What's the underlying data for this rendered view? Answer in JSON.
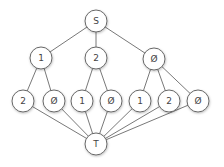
{
  "diagram": {
    "type": "graph",
    "nodes": [
      {
        "id": "S",
        "label": "S",
        "x": 96,
        "y": 21
      },
      {
        "id": "a1",
        "label": "1",
        "x": 41,
        "y": 58
      },
      {
        "id": "a2",
        "label": "2",
        "x": 96,
        "y": 58
      },
      {
        "id": "a3",
        "label": "Ø",
        "x": 154,
        "y": 59
      },
      {
        "id": "b1",
        "label": "2",
        "x": 23,
        "y": 101
      },
      {
        "id": "b2",
        "label": "Ø",
        "x": 54,
        "y": 101
      },
      {
        "id": "b3",
        "label": "1",
        "x": 82,
        "y": 101
      },
      {
        "id": "b4",
        "label": "Ø",
        "x": 111,
        "y": 101
      },
      {
        "id": "b5",
        "label": "1",
        "x": 140,
        "y": 101
      },
      {
        "id": "b6",
        "label": "2",
        "x": 169,
        "y": 101
      },
      {
        "id": "b7",
        "label": "Ø",
        "x": 198,
        "y": 101
      },
      {
        "id": "T",
        "label": "T",
        "x": 96,
        "y": 144
      }
    ],
    "edges": [
      [
        "S",
        "a1"
      ],
      [
        "S",
        "a2"
      ],
      [
        "S",
        "a3"
      ],
      [
        "a1",
        "b1"
      ],
      [
        "a1",
        "b2"
      ],
      [
        "a2",
        "b3"
      ],
      [
        "a2",
        "b4"
      ],
      [
        "a3",
        "b5"
      ],
      [
        "a3",
        "b6"
      ],
      [
        "a3",
        "b7"
      ],
      [
        "b1",
        "T"
      ],
      [
        "b2",
        "T"
      ],
      [
        "b3",
        "T"
      ],
      [
        "b4",
        "T"
      ],
      [
        "b5",
        "T"
      ],
      [
        "b6",
        "T"
      ],
      [
        "b7",
        "T"
      ]
    ],
    "node_radius": 11
  }
}
